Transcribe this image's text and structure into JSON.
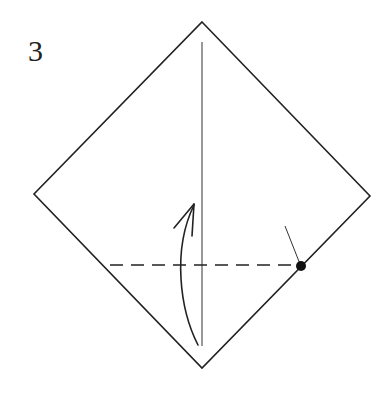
{
  "diagram": {
    "step_number": "3",
    "type": "origami-fold-step",
    "colors": {
      "line": "#222222",
      "valley_fold": "#222222",
      "reference_dot": "#111111",
      "background": "#ffffff"
    },
    "elements": [
      {
        "name": "square-paper",
        "shape": "diamond",
        "vertices": [
          [
            202,
            22
          ],
          [
            370,
            196
          ],
          [
            202,
            368
          ],
          [
            34,
            194
          ]
        ]
      },
      {
        "name": "center-crease",
        "shape": "line",
        "from": [
          202,
          42
        ],
        "to": [
          202,
          346
        ]
      },
      {
        "name": "valley-fold-line",
        "shape": "dashed-line",
        "from": [
          110,
          265
        ],
        "to": [
          301,
          265
        ]
      },
      {
        "name": "reference-point",
        "shape": "dot",
        "center": [
          301,
          266
        ]
      },
      {
        "name": "leader-line",
        "shape": "line",
        "from": [
          285,
          226
        ],
        "to": [
          301,
          266
        ]
      },
      {
        "name": "fold-up-arrow",
        "shape": "curved-arrow",
        "from": [
          198,
          345
        ],
        "to": [
          194,
          204
        ]
      }
    ]
  }
}
